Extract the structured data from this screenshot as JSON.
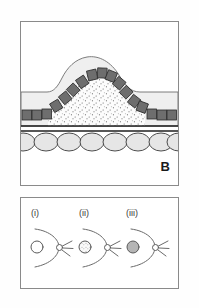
{
  "figure": {
    "type": "scientific-illustration",
    "background_color": "#fefefe",
    "panels": [
      {
        "id": "upper",
        "label": "B",
        "description": "tissue cross-section with raised dome",
        "layers": [
          {
            "name": "surface-epithelium-band",
            "fill": "#ececec",
            "stroke": "#6e6e6e"
          },
          {
            "name": "dome-bulge",
            "fill": "#efefef",
            "stroke": "#6e6e6e"
          },
          {
            "name": "columnar-cell-layer",
            "fill": "#6e6e6e",
            "stroke": "#303030"
          },
          {
            "name": "stippled-core",
            "fill": "#fbfbfb",
            "stipple": "#4a4a4a"
          },
          {
            "name": "basement-membrane-lines",
            "stroke": "#1f1f1f"
          },
          {
            "name": "oval-cell-row",
            "fill": "#e6e6e6",
            "stroke": "#3a3a3a"
          }
        ],
        "oval_count": 8
      },
      {
        "id": "lower",
        "label": "",
        "description": "three stage diagrams of a follicle and nerve node",
        "sub_panels": [
          {
            "label": "(i)",
            "circle_style": "empty",
            "circle_fill": "#ffffff"
          },
          {
            "label": "(ii)",
            "circle_style": "stippled",
            "circle_fill": "#fafafa"
          },
          {
            "label": "(iii)",
            "circle_style": "filled",
            "circle_fill": "#b5b5b5"
          }
        ],
        "node_rays": 3,
        "arc_stroke": "#6a6a6a"
      }
    ]
  },
  "colors": {
    "panel_border": "#8a8a8a",
    "dark_cell": "#6e6e6e",
    "light_tissue": "#ececec",
    "dome_fill": "#efefef",
    "oval_fill": "#e6e6e6",
    "outline": "#3a3a3a",
    "text": "#1a1a1a"
  }
}
